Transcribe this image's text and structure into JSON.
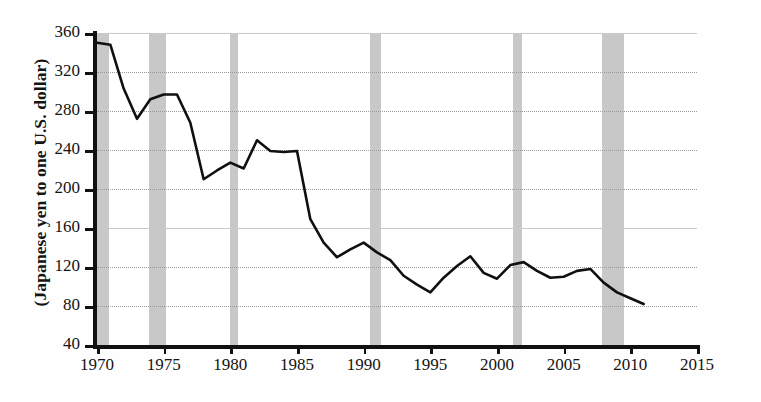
{
  "chart_data": {
    "type": "line",
    "title": "",
    "xlabel": "",
    "ylabel": "(Japanese yen to one U.S. dollar)",
    "xlim": [
      1970,
      2015
    ],
    "ylim": [
      40,
      360
    ],
    "ytick_step": 40,
    "xtick_step": 5,
    "grid": "horizontal dotted",
    "legend": "none",
    "yticks": [
      40,
      80,
      120,
      160,
      200,
      240,
      280,
      320,
      360
    ],
    "xticks": [
      1970,
      1975,
      1980,
      1985,
      1990,
      1995,
      2000,
      2005,
      2010,
      2015
    ],
    "series": [
      {
        "name": "Japanese yen per U.S. dollar",
        "x": [
          1970,
          1971,
          1972,
          1973,
          1974,
          1975,
          1976,
          1977,
          1978,
          1979,
          1980,
          1981,
          1982,
          1983,
          1984,
          1985,
          1986,
          1987,
          1988,
          1989,
          1990,
          1991,
          1992,
          1993,
          1994,
          1995,
          1996,
          1997,
          1998,
          1999,
          2000,
          2001,
          2002,
          2003,
          2004,
          2005,
          2006,
          2007,
          2008,
          2009,
          2010,
          2011
        ],
        "values": [
          350,
          348,
          303,
          272,
          292,
          297,
          297,
          268,
          210,
          219,
          227,
          221,
          250,
          239,
          238,
          239,
          169,
          145,
          130,
          138,
          145,
          135,
          127,
          111,
          102,
          94,
          109,
          121,
          131,
          114,
          108,
          122,
          125,
          116,
          109,
          110,
          116,
          118,
          104,
          94,
          88,
          82
        ]
      }
    ],
    "recession_bands": [
      {
        "start": 1969.9,
        "end": 1970.9
      },
      {
        "start": 1973.9,
        "end": 1975.2
      },
      {
        "start": 1980.0,
        "end": 1980.6
      },
      {
        "start": 1990.5,
        "end": 1991.3
      },
      {
        "start": 2001.2,
        "end": 2001.9
      },
      {
        "start": 2007.9,
        "end": 2009.5
      }
    ]
  }
}
